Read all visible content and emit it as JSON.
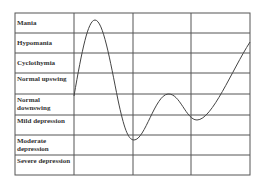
{
  "diagram": {
    "type": "mood-spectrum-chart",
    "rows": [
      {
        "label": "Mania"
      },
      {
        "label": "Hypomania"
      },
      {
        "label": "Cyclothymia"
      },
      {
        "label": "Normal upswing"
      },
      {
        "label": "Normal downswing"
      },
      {
        "label": "Mild depression"
      },
      {
        "label": "Moderate depression"
      },
      {
        "label": "Severe depression"
      }
    ],
    "curve_description": "Wavy mood line: rises from normal to a mania peak, falls to mild/moderate depression trough, rises to normal upswing, dips to normal downswing/mild depression, then rises toward hypomania"
  },
  "colors": {
    "grid": "#555555",
    "curve": "#444444",
    "text": "#333333",
    "background": "#ffffff"
  }
}
